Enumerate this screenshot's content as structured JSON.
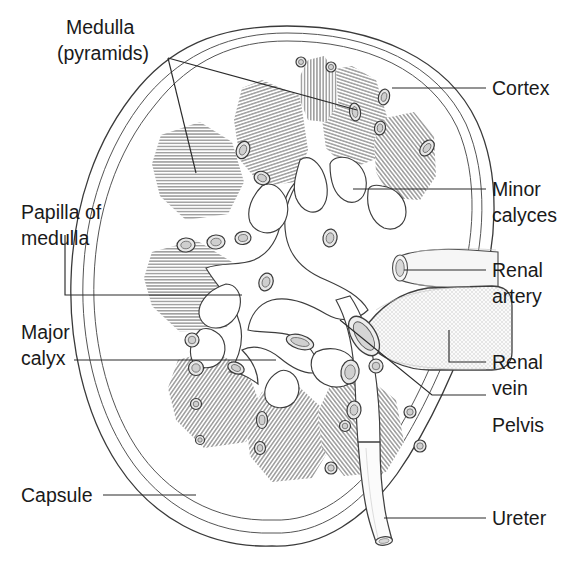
{
  "figure": {
    "background_color": "#ffffff",
    "line_color": "#3a3a3a",
    "text_color": "#1a1a1a",
    "width": 574,
    "height": 564
  },
  "labels": {
    "medulla": {
      "line1": "Medulla",
      "line2": "(pyramids)"
    },
    "cortex": {
      "line1": "Cortex"
    },
    "minor_calyces": {
      "line1": "Minor",
      "line2": "calyces"
    },
    "renal_artery": {
      "line1": "Renal",
      "line2": "artery"
    },
    "renal_vein": {
      "line1": "Renal",
      "line2": "vein"
    },
    "pelvis": {
      "line1": "Pelvis"
    },
    "ureter": {
      "line1": "Ureter"
    },
    "papilla": {
      "line1": "Papilla of",
      "line2": "medulla"
    },
    "major_calyx": {
      "line1": "Major",
      "line2": "calyx"
    },
    "capsule": {
      "line1": "Capsule"
    }
  }
}
